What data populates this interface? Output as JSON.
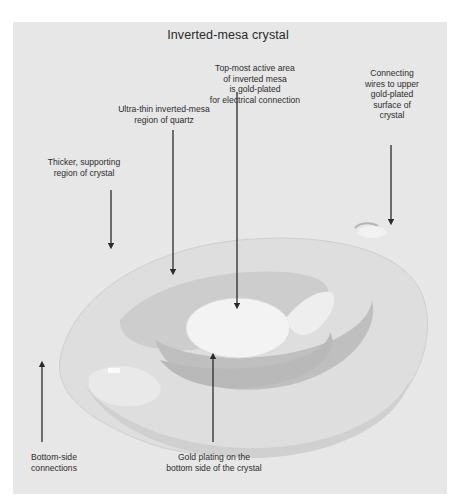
{
  "figure": {
    "title": "Inverted-mesa crystal",
    "labels": {
      "thicker_region": [
        "Thicker, supporting",
        "region of crystal"
      ],
      "ultra_thin_region": [
        "Ultra-thin inverted-mesa",
        "region of quartz"
      ],
      "top_active_area": [
        "Top-most active area",
        "of inverted mesa",
        "is gold-plated",
        "for electrical connection"
      ],
      "connecting_wires": [
        "Connecting",
        "wires to upper",
        "gold-plated",
        "surface of",
        "crystal"
      ],
      "bottom_connections": [
        "Bottom-side",
        "connections"
      ],
      "gold_plating_bottom": [
        "Gold plating on the",
        "bottom side of the crystal"
      ]
    },
    "colors": {
      "background": "#e7e7e7",
      "text": "#2d2d2d",
      "arrow": "#2a2a2a",
      "crystal_light": "#f4f4f4",
      "crystal_mid": "#d2d2d2",
      "crystal_dark": "#bdbdbd"
    }
  }
}
